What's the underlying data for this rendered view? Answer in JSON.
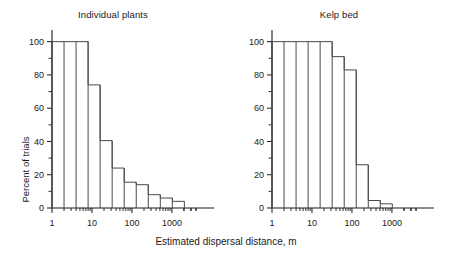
{
  "figure": {
    "xlabel": "Estimated dispersal distance, m",
    "ylabel": "Percent of trials",
    "title_left": "Individual plants",
    "title_right": "Kelp bed"
  },
  "axis": {
    "y_ticks_major": [
      "0",
      "20",
      "40",
      "60",
      "80",
      "100"
    ],
    "y_ticks_major_values": [
      0,
      20,
      40,
      60,
      80,
      100
    ],
    "y_ticks_minor_values": [
      10,
      30,
      50,
      70,
      90
    ],
    "y_range": [
      0,
      104
    ],
    "x_ticks_major": [
      "1",
      "10",
      "100",
      "1000"
    ],
    "x_ticks_major_values": [
      1,
      10,
      100,
      1000
    ],
    "x_range": [
      1,
      4000
    ],
    "x_scale": "log10",
    "grid": false
  },
  "chart_data": [
    {
      "type": "bar",
      "title": "Individual plants",
      "xlabel": "Estimated dispersal distance, m",
      "ylabel": "Percent of trials",
      "x_scale": "log10",
      "xlim": [
        1,
        4000
      ],
      "ylim": [
        0,
        104
      ],
      "bin_edges": [
        1,
        2,
        4,
        8,
        16,
        32,
        64,
        128,
        256,
        512,
        1024,
        2048,
        3000
      ],
      "categories": [
        "1-2",
        "2-4",
        "4-8",
        "8-16",
        "16-32",
        "32-64",
        "64-128",
        "128-256",
        "256-512",
        "512-1024",
        "1024-3000"
      ],
      "values": [
        100,
        100,
        100,
        74,
        40.5,
        24,
        15.5,
        14,
        8,
        6,
        4
      ],
      "legend": null
    },
    {
      "type": "bar",
      "title": "Kelp bed",
      "xlabel": "Estimated dispersal distance, m",
      "ylabel": "Percent of trials",
      "x_scale": "log10",
      "xlim": [
        1,
        4000
      ],
      "ylim": [
        0,
        104
      ],
      "bin_edges": [
        1,
        2,
        4,
        8,
        16,
        32,
        64,
        128,
        256,
        512,
        1024
      ],
      "categories": [
        "1-2",
        "2-4",
        "4-8",
        "8-16",
        "16-32",
        "32-64",
        "64-128",
        "128-256",
        "256-512",
        "512-1024"
      ],
      "values": [
        100,
        100,
        100,
        100,
        100,
        91,
        83,
        26,
        4.5,
        2.5
      ],
      "legend": null
    }
  ],
  "colors": {
    "axis": "#1a1a1a",
    "bar_stroke": "#4a4a4a",
    "background": "#ffffff",
    "text": "#1a1a1a"
  }
}
